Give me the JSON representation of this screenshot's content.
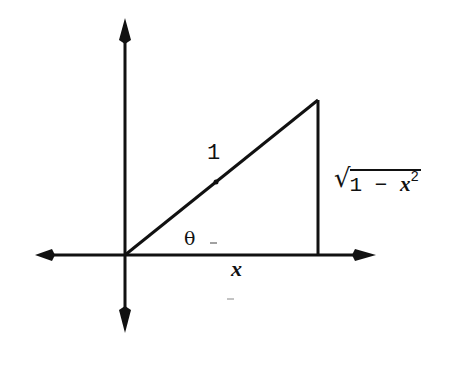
{
  "diagram": {
    "type": "right-triangle-unit-circle",
    "colors": {
      "stroke": "#111111",
      "background": "#ffffff"
    },
    "axes": {
      "x_axis": {
        "arrows": [
          "left",
          "right"
        ]
      },
      "y_axis": {
        "arrows": [
          "up",
          "down"
        ]
      }
    },
    "labels": {
      "hypotenuse": "1",
      "angle": "θ",
      "adjacent": "x",
      "opposite_radical": "√",
      "opposite_prefix": "1 − ",
      "opposite_var": "x",
      "opposite_exponent": "2"
    }
  }
}
